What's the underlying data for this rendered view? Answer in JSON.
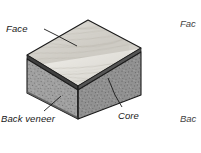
{
  "figure": {
    "type": "isometric-block-diagram",
    "background": "#ffffff",
    "labels": {
      "face": "Face",
      "back_veneer": "Back veneer",
      "core": "Core"
    },
    "margin_clipped_labels": {
      "top": "Fac",
      "bottom": "Bac"
    },
    "colors": {
      "face_veneer": "#d7d5cf",
      "face_veneer_light": "#e8e7e2",
      "core_left": "#9d9d9d",
      "core_right": "#8f8f8f",
      "veneer_edge": "#4a4a4a",
      "outline": "#1a1a1a",
      "leader_line": "#1a1a1a",
      "text": "#1a1a1a"
    },
    "geometry": {
      "top_apex": [
        88,
        20
      ],
      "top_right": [
        141,
        48
      ],
      "top_left": [
        27,
        55
      ],
      "top_front": [
        78,
        86
      ],
      "bottom_front": [
        78,
        119
      ],
      "bottom_left": [
        27,
        93
      ],
      "bottom_right": [
        141,
        95
      ]
    },
    "leaders": {
      "face": [
        [
          44,
          29
        ],
        [
          77,
          46
        ]
      ],
      "back_veneer": [
        [
          44,
          112
        ],
        [
          60,
          97
        ]
      ],
      "core": [
        [
          122,
          108
        ],
        [
          108,
          78
        ]
      ]
    }
  }
}
